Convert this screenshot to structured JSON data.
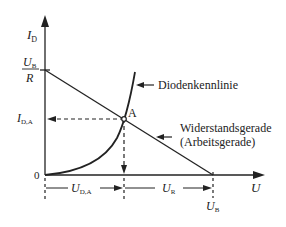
{
  "diagram": {
    "type": "diode-load-line",
    "axes": {
      "y_label": "I",
      "y_label_sub": "D",
      "x_label": "U",
      "origin": "0"
    },
    "y_ticks": {
      "ub_over_r_num": "U",
      "ub_over_r_num_sub": "B",
      "ub_over_r_den": "R",
      "ida": "I",
      "ida_sub": "D,A"
    },
    "x_ticks": {
      "ub": "U",
      "ub_sub": "B"
    },
    "dimensions": {
      "uda": "U",
      "uda_sub": "D,A",
      "ur": "U",
      "ur_sub": "R"
    },
    "annotations": {
      "point": "A",
      "diode_curve": "Diodenkennlinie",
      "load_line_1": "Widerstandsgerade",
      "load_line_2": "(Arbeitsgerade)"
    },
    "colors": {
      "line": "#222222",
      "background": "#ffffff"
    }
  }
}
